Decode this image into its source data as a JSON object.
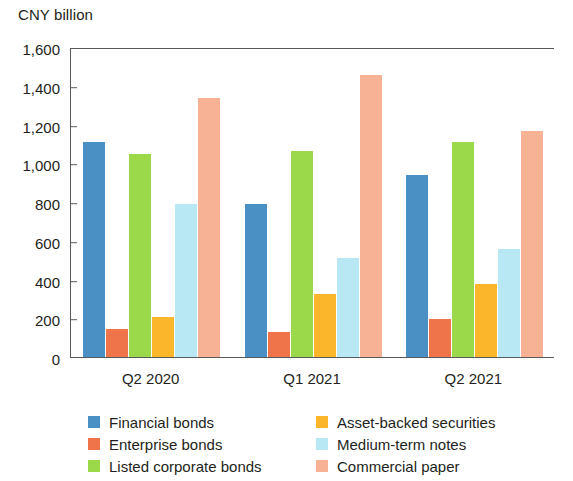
{
  "chart_data": {
    "type": "bar",
    "title": "",
    "subtitle": "",
    "ylabel": "CNY billion",
    "xlabel": "",
    "ylim": [
      0,
      1600
    ],
    "ytick_step": 200,
    "ytick_labels": [
      "1,600",
      "1,400",
      "1,200",
      "1,000",
      "800",
      "600",
      "400",
      "200",
      "0"
    ],
    "ytick_values": [
      1600,
      1400,
      1200,
      1000,
      800,
      600,
      400,
      200,
      0
    ],
    "grid": false,
    "legend_position": "bottom",
    "categories": [
      "Q2 2020",
      "Q1 2021",
      "Q2 2021"
    ],
    "series": [
      {
        "name": "Financial bonds",
        "color": "#4a90c4",
        "values": [
          1110,
          790,
          940
        ]
      },
      {
        "name": "Enterprise bonds",
        "color": "#f0744a",
        "values": [
          145,
          130,
          195
        ]
      },
      {
        "name": "Listed corporate bonds",
        "color": "#9bd84a",
        "values": [
          1050,
          1065,
          1110
        ]
      },
      {
        "name": "Asset-backed securities",
        "color": "#fcb62c",
        "values": [
          205,
          325,
          375
        ]
      },
      {
        "name": "Medium-term notes",
        "color": "#b9e8f5",
        "values": [
          790,
          510,
          555
        ]
      },
      {
        "name": "Commercial paper",
        "color": "#f7b195",
        "values": [
          1335,
          1455,
          1165
        ]
      }
    ]
  },
  "axis": {
    "title": "CNY billion"
  },
  "legend": {
    "columns": [
      [
        {
          "label": "Financial bonds",
          "color": "#4a90c4"
        },
        {
          "label": "Enterprise bonds",
          "color": "#f0744a"
        },
        {
          "label": "Listed corporate bonds",
          "color": "#9bd84a"
        }
      ],
      [
        {
          "label": "Asset-backed securities",
          "color": "#fcb62c"
        },
        {
          "label": "Medium-term notes",
          "color": "#b9e8f5"
        },
        {
          "label": "Commercial paper",
          "color": "#f7b195"
        }
      ]
    ]
  }
}
